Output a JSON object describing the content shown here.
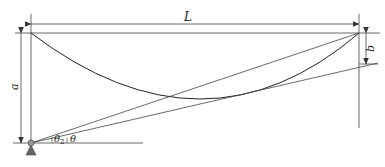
{
  "diagram": {
    "labels": {
      "span": "L",
      "height": "a",
      "offset": "b",
      "angle_chord": "θ",
      "angle_sub": "2",
      "angle_tangent": "θ"
    },
    "colors": {
      "line": "#333333",
      "curve": "#222222",
      "support": "#555555",
      "pivot": "#888888"
    }
  }
}
